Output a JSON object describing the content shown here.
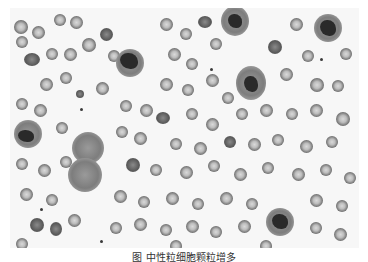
{
  "figure": {
    "background_color": "#f7f7f7",
    "white_blood_cells": [
      {
        "x": 18,
        "y": 120,
        "r": 14
      },
      {
        "x": 120,
        "y": 55,
        "r": 14
      },
      {
        "x": 225,
        "y": 10,
        "r": 14
      },
      {
        "x": 242,
        "y": 68,
        "r": 16
      },
      {
        "x": 318,
        "y": 20,
        "r": 14
      },
      {
        "x": 78,
        "y": 138,
        "r": 17
      },
      {
        "x": 75,
        "y": 165,
        "r": 17
      },
      {
        "x": 270,
        "y": 208,
        "r": 14
      }
    ]
  },
  "caption": {
    "text": "图 中性粒细胞颗粒增多"
  }
}
